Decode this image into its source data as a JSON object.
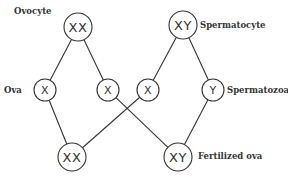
{
  "labels": {
    "ovocyte": "Ovocyte",
    "spermatocyte": "Spermatocyte",
    "ova": "Ova",
    "spermatozoa": "Spermatozoa",
    "fertilized": "Fertilized ova"
  },
  "nodes": {
    "ovocyte": "XX",
    "spermatocyte": "XY",
    "ova_x1": "X",
    "ova_x2": "X",
    "sperm_x": "X",
    "sperm_y": "Y",
    "fert_xx": "XX",
    "fert_xy": "XY"
  },
  "edges": [
    [
      "ovocyte",
      "ova_x1"
    ],
    [
      "ovocyte",
      "ova_x2"
    ],
    [
      "spermatocyte",
      "sperm_x"
    ],
    [
      "spermatocyte",
      "sperm_y"
    ],
    [
      "ova_x1",
      "fert_xx"
    ],
    [
      "sperm_x",
      "fert_xx"
    ],
    [
      "ova_x2",
      "fert_xy"
    ],
    [
      "sperm_y",
      "fert_xy"
    ]
  ]
}
